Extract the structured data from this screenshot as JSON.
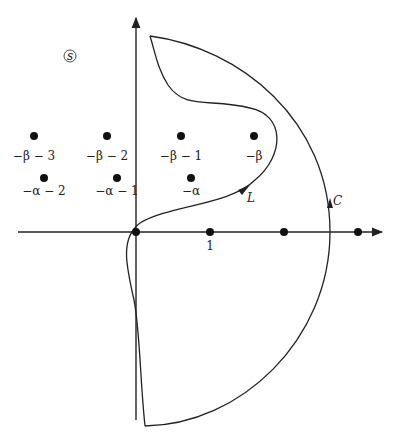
{
  "diagram": {
    "plane_label": "s",
    "colors": {
      "stroke": "#222222",
      "background": "#ffffff"
    },
    "upper_points": [
      {
        "label": "−β − 3",
        "x": 34,
        "y": 136
      },
      {
        "label": "−β − 2",
        "x": 107,
        "y": 136
      },
      {
        "label": "−β − 1",
        "x": 181,
        "y": 136
      },
      {
        "label": "−β",
        "x": 254,
        "y": 136
      }
    ],
    "lower_points": [
      {
        "label": "−α − 2",
        "x": 44,
        "y": 178
      },
      {
        "label": "−α − 1",
        "x": 117,
        "y": 178
      },
      {
        "label": "−α",
        "x": 191,
        "y": 178
      }
    ],
    "axis_points": [
      {
        "label": "",
        "x": 136,
        "y": 232
      },
      {
        "label": "1",
        "x": 210,
        "y": 232
      },
      {
        "label": "",
        "x": 284,
        "y": 232
      },
      {
        "label": "",
        "x": 358,
        "y": 232
      }
    ],
    "contours": [
      {
        "name": "L",
        "label": "L"
      },
      {
        "name": "C",
        "label": "C"
      }
    ]
  }
}
